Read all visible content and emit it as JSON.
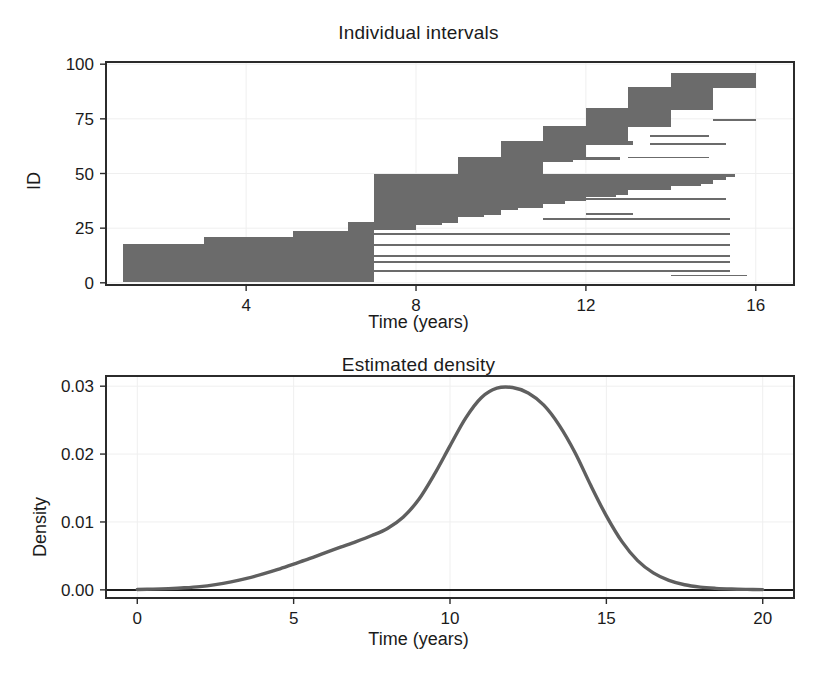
{
  "figure": {
    "background": "#ffffff",
    "panels": [
      {
        "id": "intervals",
        "title": "Individual intervals",
        "xlabel": "Time (years)",
        "ylabel": "ID"
      },
      {
        "id": "density",
        "title": "Estimated density",
        "xlabel": "Time (years)",
        "ylabel": "Density"
      }
    ]
  },
  "style": {
    "bar_color": "#6b6b6b",
    "curve_color": "#5f5f5f",
    "axis_color": "#2b2b2b",
    "grid_color": "#efefef",
    "baseline_color": "#1d1d1d"
  },
  "chart_data": [
    {
      "type": "bar",
      "orientation": "horizontal",
      "title": "Individual intervals",
      "xlabel": "Time (years)",
      "ylabel": "ID",
      "xlim": [
        0.7,
        16.9
      ],
      "ylim": [
        -1,
        101
      ],
      "xticks": [
        4,
        8,
        12,
        16
      ],
      "xtick_labels": [
        "4",
        "8",
        "12",
        "16"
      ],
      "yticks": [
        0,
        25,
        50,
        75,
        100
      ],
      "ytick_labels": [
        "0",
        "25",
        "50",
        "75",
        "100"
      ],
      "grid": true,
      "legend": "none",
      "note": "Each row is one subject's censoring interval (left, right) drawn as a horizontal bar, sorted by interval midpoint.",
      "intervals": [
        {
          "id": 1,
          "left": 1.1,
          "right": 7.0
        },
        {
          "id": 2,
          "left": 1.1,
          "right": 7.0
        },
        {
          "id": 3,
          "left": 1.1,
          "right": 7.0
        },
        {
          "id": 4,
          "left": 1.1,
          "right": 7.0
        },
        {
          "id": 5,
          "left": 1.1,
          "right": 7.0
        },
        {
          "id": 6,
          "left": 1.1,
          "right": 7.0
        },
        {
          "id": 7,
          "left": 1.1,
          "right": 7.0
        },
        {
          "id": 8,
          "left": 1.1,
          "right": 7.0
        },
        {
          "id": 9,
          "left": 1.1,
          "right": 7.0
        },
        {
          "id": 10,
          "left": 1.1,
          "right": 7.0
        },
        {
          "id": 11,
          "left": 1.1,
          "right": 7.0
        },
        {
          "id": 12,
          "left": 1.1,
          "right": 7.0
        },
        {
          "id": 13,
          "left": 1.1,
          "right": 7.0
        },
        {
          "id": 14,
          "left": 1.1,
          "right": 7.0
        },
        {
          "id": 15,
          "left": 1.1,
          "right": 7.0
        },
        {
          "id": 16,
          "left": 1.1,
          "right": 7.0
        },
        {
          "id": 17,
          "left": 1.1,
          "right": 7.0
        },
        {
          "id": 18,
          "left": 3.0,
          "right": 7.0
        },
        {
          "id": 19,
          "left": 3.0,
          "right": 7.0
        },
        {
          "id": 20,
          "left": 3.0,
          "right": 7.0
        },
        {
          "id": 21,
          "left": 5.1,
          "right": 7.0
        },
        {
          "id": 22,
          "left": 5.1,
          "right": 7.0
        },
        {
          "id": 23,
          "left": 5.1,
          "right": 7.0
        },
        {
          "id": 24,
          "left": 6.4,
          "right": 7.0
        },
        {
          "id": 25,
          "left": 6.4,
          "right": 8.0
        },
        {
          "id": 26,
          "left": 6.4,
          "right": 8.0
        },
        {
          "id": 27,
          "left": 6.4,
          "right": 8.6
        },
        {
          "id": 28,
          "left": 7.0,
          "right": 9.0
        },
        {
          "id": 29,
          "left": 7.0,
          "right": 9.0
        },
        {
          "id": 30,
          "left": 7.0,
          "right": 9.0
        },
        {
          "id": 31,
          "left": 7.0,
          "right": 9.6
        },
        {
          "id": 32,
          "left": 7.0,
          "right": 10.0
        },
        {
          "id": 33,
          "left": 7.0,
          "right": 10.0
        },
        {
          "id": 34,
          "left": 7.0,
          "right": 10.4
        },
        {
          "id": 35,
          "left": 7.0,
          "right": 11.0
        },
        {
          "id": 36,
          "left": 7.0,
          "right": 11.0
        },
        {
          "id": 37,
          "left": 7.0,
          "right": 11.5
        },
        {
          "id": 38,
          "left": 7.0,
          "right": 12.0
        },
        {
          "id": 39,
          "left": 7.0,
          "right": 12.0
        },
        {
          "id": 40,
          "left": 7.0,
          "right": 12.7
        },
        {
          "id": 41,
          "left": 7.0,
          "right": 13.0
        },
        {
          "id": 42,
          "left": 7.0,
          "right": 13.0
        },
        {
          "id": 43,
          "left": 7.0,
          "right": 14.0
        },
        {
          "id": 44,
          "left": 7.0,
          "right": 14.0
        },
        {
          "id": 45,
          "left": 7.0,
          "right": 14.7
        },
        {
          "id": 46,
          "left": 7.0,
          "right": 15.0
        },
        {
          "id": 47,
          "left": 7.0,
          "right": 15.0
        },
        {
          "id": 48,
          "left": 7.0,
          "right": 15.3
        },
        {
          "id": 49,
          "left": 7.0,
          "right": 15.5
        },
        {
          "id": 50,
          "left": 9.0,
          "right": 11.0
        },
        {
          "id": 51,
          "left": 9.0,
          "right": 11.0
        },
        {
          "id": 52,
          "left": 9.0,
          "right": 11.0
        },
        {
          "id": 53,
          "left": 9.0,
          "right": 11.0
        },
        {
          "id": 54,
          "left": 9.0,
          "right": 11.0
        },
        {
          "id": 55,
          "left": 9.0,
          "right": 11.0
        },
        {
          "id": 56,
          "left": 9.0,
          "right": 11.7
        },
        {
          "id": 57,
          "left": 9.0,
          "right": 12.8
        },
        {
          "id": 58,
          "left": 10.0,
          "right": 12.0
        },
        {
          "id": 59,
          "left": 10.0,
          "right": 12.0
        },
        {
          "id": 60,
          "left": 10.0,
          "right": 12.0
        },
        {
          "id": 61,
          "left": 10.0,
          "right": 12.0
        },
        {
          "id": 62,
          "left": 10.0,
          "right": 12.0
        },
        {
          "id": 63,
          "left": 10.0,
          "right": 12.0
        },
        {
          "id": 64,
          "left": 10.0,
          "right": 13.1
        },
        {
          "id": 65,
          "left": 11.0,
          "right": 13.0
        },
        {
          "id": 66,
          "left": 11.0,
          "right": 13.0
        },
        {
          "id": 67,
          "left": 11.0,
          "right": 13.0
        },
        {
          "id": 68,
          "left": 11.0,
          "right": 13.0
        },
        {
          "id": 69,
          "left": 11.0,
          "right": 13.0
        },
        {
          "id": 70,
          "left": 11.0,
          "right": 13.0
        },
        {
          "id": 71,
          "left": 11.0,
          "right": 13.0
        },
        {
          "id": 72,
          "left": 12.0,
          "right": 14.0
        },
        {
          "id": 73,
          "left": 12.0,
          "right": 14.0
        },
        {
          "id": 74,
          "left": 12.0,
          "right": 14.0
        },
        {
          "id": 75,
          "left": 12.0,
          "right": 14.0
        },
        {
          "id": 76,
          "left": 12.0,
          "right": 14.0
        },
        {
          "id": 77,
          "left": 12.0,
          "right": 14.0
        },
        {
          "id": 78,
          "left": 12.0,
          "right": 14.0
        },
        {
          "id": 79,
          "left": 12.0,
          "right": 14.0
        },
        {
          "id": 80,
          "left": 13.0,
          "right": 15.0
        },
        {
          "id": 81,
          "left": 13.0,
          "right": 15.0
        },
        {
          "id": 82,
          "left": 13.0,
          "right": 15.0
        },
        {
          "id": 83,
          "left": 13.0,
          "right": 15.0
        },
        {
          "id": 84,
          "left": 13.0,
          "right": 15.0
        },
        {
          "id": 85,
          "left": 13.0,
          "right": 15.0
        },
        {
          "id": 86,
          "left": 13.0,
          "right": 15.0
        },
        {
          "id": 87,
          "left": 13.0,
          "right": 15.0
        },
        {
          "id": 88,
          "left": 13.0,
          "right": 15.0
        },
        {
          "id": 89,
          "left": 13.0,
          "right": 15.0
        },
        {
          "id": 90,
          "left": 14.0,
          "right": 16.0
        },
        {
          "id": 91,
          "left": 14.0,
          "right": 16.0
        },
        {
          "id": 92,
          "left": 14.0,
          "right": 16.0
        },
        {
          "id": 93,
          "left": 14.0,
          "right": 16.0
        },
        {
          "id": 94,
          "left": 14.0,
          "right": 16.0
        },
        {
          "id": 95,
          "left": 14.0,
          "right": 16.0
        }
      ],
      "extra_censored_rows": [
        {
          "id": 22,
          "left": 7.0,
          "right": 15.4
        },
        {
          "id": 17,
          "left": 7.0,
          "right": 15.4
        },
        {
          "id": 12,
          "left": 7.0,
          "right": 15.4
        },
        {
          "id": 9,
          "left": 7.0,
          "right": 15.4
        },
        {
          "id": 5,
          "left": 7.0,
          "right": 15.4
        },
        {
          "id": 3,
          "left": 14.0,
          "right": 15.8
        },
        {
          "id": 29,
          "left": 11.0,
          "right": 15.4
        },
        {
          "id": 31,
          "left": 12.0,
          "right": 13.1
        },
        {
          "id": 38,
          "left": 12.0,
          "right": 15.3
        },
        {
          "id": 48,
          "left": 13.0,
          "right": 15.1
        },
        {
          "id": 57,
          "left": 13.0,
          "right": 14.9
        },
        {
          "id": 63,
          "left": 13.5,
          "right": 15.3
        },
        {
          "id": 67,
          "left": 13.5,
          "right": 14.9
        },
        {
          "id": 74,
          "left": 15.0,
          "right": 16.0
        },
        {
          "id": 79,
          "left": 14.0,
          "right": 15.0
        },
        {
          "id": 90,
          "left": 15.0,
          "right": 16.0
        }
      ]
    },
    {
      "type": "line",
      "title": "Estimated density",
      "xlabel": "Time (years)",
      "ylabel": "Density",
      "xlim": [
        -1.0,
        21.0
      ],
      "ylim": [
        -0.0012,
        0.0315
      ],
      "xticks": [
        0,
        5,
        10,
        15,
        20
      ],
      "xtick_labels": [
        "0",
        "5",
        "10",
        "15",
        "20"
      ],
      "yticks": [
        0.0,
        0.01,
        0.02,
        0.03
      ],
      "ytick_labels": [
        "0.00",
        "0.01",
        "0.02",
        "0.03"
      ],
      "grid": true,
      "legend": "none",
      "peak": {
        "x": 12.0,
        "y": 0.0298
      },
      "x": [
        0.0,
        0.5,
        1.0,
        1.5,
        2.0,
        2.5,
        3.0,
        3.5,
        4.0,
        4.5,
        5.0,
        5.5,
        6.0,
        6.5,
        7.0,
        7.5,
        8.0,
        8.5,
        9.0,
        9.5,
        10.0,
        10.5,
        11.0,
        11.5,
        12.0,
        12.5,
        13.0,
        13.5,
        14.0,
        14.5,
        15.0,
        15.5,
        16.0,
        16.5,
        17.0,
        17.5,
        18.0,
        18.5,
        19.0,
        19.5,
        20.0
      ],
      "y": [
        5e-05,
        0.0001,
        0.00018,
        0.0003,
        0.00048,
        0.00078,
        0.00118,
        0.00168,
        0.0023,
        0.003,
        0.0038,
        0.0046,
        0.00545,
        0.00628,
        0.0071,
        0.008,
        0.00905,
        0.0107,
        0.0133,
        0.017,
        0.0212,
        0.0253,
        0.0283,
        0.0297,
        0.0298,
        0.029,
        0.0272,
        0.0242,
        0.0202,
        0.0154,
        0.0109,
        0.0071,
        0.0043,
        0.0025,
        0.0014,
        0.00075,
        0.0004,
        0.00022,
        0.00012,
        7e-05,
        4e-05
      ]
    }
  ]
}
